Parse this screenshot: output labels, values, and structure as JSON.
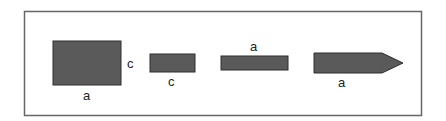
{
  "diagram": {
    "frame": {
      "x": 24,
      "y": 11,
      "width": 398,
      "height": 105,
      "stroke": "#666666"
    },
    "shape_fill": "#5a5a5a",
    "shape_stroke": "#2e2e2e",
    "shapes": [
      {
        "type": "square",
        "x": 53,
        "y": 41,
        "width": 68,
        "height": 44,
        "labels": [
          {
            "text": "c",
            "x": 131,
            "y": 68
          },
          {
            "text": "a",
            "x": 87,
            "y": 100
          }
        ]
      },
      {
        "type": "rectangle",
        "x": 150,
        "y": 54,
        "width": 45,
        "height": 18,
        "labels": [
          {
            "text": "c",
            "x": 172,
            "y": 86
          }
        ]
      },
      {
        "type": "bar",
        "x": 221,
        "y": 56,
        "width": 67,
        "height": 14,
        "labels": [
          {
            "text": "a",
            "x": 254,
            "y": 51
          }
        ]
      },
      {
        "type": "arrow",
        "x": 314,
        "y": 53,
        "body_end": 382,
        "tip_x": 403,
        "height": 20,
        "labels": [
          {
            "text": "a",
            "x": 342,
            "y": 87
          }
        ]
      }
    ]
  }
}
